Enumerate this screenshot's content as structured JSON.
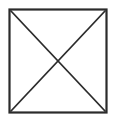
{
  "figure": {
    "name": "square-with-diagonals",
    "canvas": {
      "width": 116,
      "height": 124,
      "background_color": "#ffffff"
    },
    "stroke": {
      "color": "#2b2b2b",
      "outline_width": 2.2,
      "diagonal_width": 1.8,
      "linecap": "butt",
      "linejoin": "miter"
    },
    "square": {
      "label": "square-outline",
      "x": 9.5,
      "y": 9.5,
      "width": 97,
      "height": 103,
      "fill": "none"
    },
    "diagonals": [
      {
        "label": "diagonal-top-left-to-bottom-right",
        "x1": 10.5,
        "y1": 10.5,
        "x2": 105.5,
        "y2": 111.5
      },
      {
        "label": "diagonal-top-right-to-bottom-left",
        "x1": 105.5,
        "y1": 10.5,
        "x2": 10.5,
        "y2": 111.5
      }
    ],
    "intersection": {
      "label": "center-crossing-point",
      "x": 58,
      "y": 61
    }
  },
  "chart_data": {
    "type": "diagram",
    "title": "",
    "shapes": [
      {
        "kind": "rectangle",
        "name": "square",
        "corners": [
          [
            9.5,
            9.5
          ],
          [
            106.5,
            9.5
          ],
          [
            106.5,
            112.5
          ],
          [
            9.5,
            112.5
          ]
        ],
        "stroke": "#2b2b2b",
        "fill": "none"
      },
      {
        "kind": "line",
        "name": "diagonal-1",
        "from": [
          10.5,
          10.5
        ],
        "to": [
          105.5,
          111.5
        ],
        "stroke": "#2b2b2b"
      },
      {
        "kind": "line",
        "name": "diagonal-2",
        "from": [
          105.5,
          10.5
        ],
        "to": [
          10.5,
          111.5
        ],
        "stroke": "#2b2b2b"
      }
    ],
    "annotations": [],
    "legend": []
  }
}
